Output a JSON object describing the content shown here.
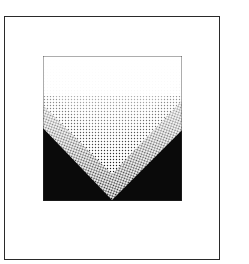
{
  "artwork": {
    "title": "Stippled chevron print",
    "style": "stipple",
    "colors": {
      "background": "#ffffff",
      "frame_border": "#2a2a2a",
      "ink": "#0a0a0a"
    },
    "chevrons": [
      {
        "name": "inner",
        "apex_y": 152,
        "left_y": 87,
        "right_y": 80
      },
      {
        "name": "middle",
        "apex_y": 174,
        "left_y": 105,
        "right_y": 100
      },
      {
        "name": "outer",
        "apex_y": 199,
        "left_y": 128,
        "right_y": 130
      }
    ]
  }
}
